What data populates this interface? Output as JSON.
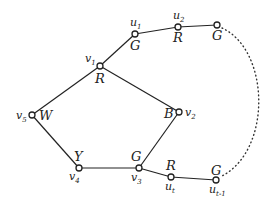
{
  "diagram": {
    "type": "graph",
    "nodes": [
      {
        "id": "v1",
        "name": "v",
        "sub": "1",
        "color": "R"
      },
      {
        "id": "v2",
        "name": "v",
        "sub": "2",
        "color": "B"
      },
      {
        "id": "v3",
        "name": "v",
        "sub": "3",
        "color": "G"
      },
      {
        "id": "v4",
        "name": "v",
        "sub": "4",
        "color": "Y"
      },
      {
        "id": "v5",
        "name": "v",
        "sub": "5",
        "color": "W"
      },
      {
        "id": "u1",
        "name": "u",
        "sub": "1",
        "color": "G"
      },
      {
        "id": "u2",
        "name": "u",
        "sub": "2",
        "color": "R"
      },
      {
        "id": "u3",
        "name": "",
        "sub": "",
        "color": "G"
      },
      {
        "id": "ut",
        "name": "u",
        "sub": "t",
        "color": "R"
      },
      {
        "id": "ut1",
        "name": "u",
        "sub": "t-1",
        "color": "G"
      }
    ],
    "edges": [
      [
        "v1",
        "v2"
      ],
      [
        "v2",
        "v3"
      ],
      [
        "v3",
        "v4"
      ],
      [
        "v4",
        "v5"
      ],
      [
        "v5",
        "v1"
      ],
      [
        "v1",
        "u1"
      ],
      [
        "u1",
        "u2"
      ],
      [
        "u2",
        "u3"
      ],
      [
        "v3",
        "ut"
      ],
      [
        "ut",
        "ut1"
      ]
    ],
    "dotted_edges": [
      [
        "u3",
        "ut1"
      ]
    ]
  }
}
